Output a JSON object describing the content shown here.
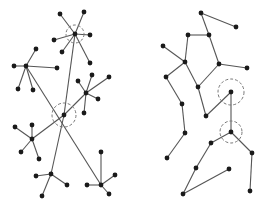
{
  "colors": {
    "background": "#ffffff",
    "edge": "#555555",
    "node": "#1a1a1a",
    "highlight": "#777777"
  },
  "graphs": [
    {
      "name": "left-graph",
      "node_radius": 2.4,
      "nodes": [
        [
          75,
          34
        ],
        [
          60,
          14
        ],
        [
          84,
          12
        ],
        [
          90,
          35
        ],
        [
          54,
          40
        ],
        [
          62,
          52
        ],
        [
          90,
          63
        ],
        [
          26,
          66
        ],
        [
          36,
          49
        ],
        [
          14,
          66
        ],
        [
          57,
          68
        ],
        [
          18,
          89
        ],
        [
          33,
          90
        ],
        [
          86,
          93
        ],
        [
          78,
          81
        ],
        [
          92,
          75
        ],
        [
          109,
          77
        ],
        [
          98,
          99
        ],
        [
          84,
          113
        ],
        [
          64,
          115
        ],
        [
          32,
          139
        ],
        [
          15,
          127
        ],
        [
          32,
          125
        ],
        [
          21,
          152
        ],
        [
          39,
          159
        ],
        [
          51,
          174
        ],
        [
          36,
          176
        ],
        [
          67,
          185
        ],
        [
          42,
          196
        ],
        [
          101,
          185
        ],
        [
          101,
          152
        ],
        [
          115,
          175
        ],
        [
          87,
          185
        ],
        [
          109,
          194
        ]
      ],
      "edges": [
        [
          0,
          1
        ],
        [
          0,
          2
        ],
        [
          0,
          3
        ],
        [
          0,
          4
        ],
        [
          0,
          5
        ],
        [
          0,
          6
        ],
        [
          7,
          8
        ],
        [
          7,
          9
        ],
        [
          7,
          10
        ],
        [
          7,
          11
        ],
        [
          7,
          12
        ],
        [
          13,
          14
        ],
        [
          13,
          15
        ],
        [
          13,
          16
        ],
        [
          13,
          17
        ],
        [
          13,
          18
        ],
        [
          0,
          19
        ],
        [
          7,
          29
        ],
        [
          13,
          19
        ],
        [
          19,
          20
        ],
        [
          19,
          25
        ],
        [
          20,
          21
        ],
        [
          20,
          22
        ],
        [
          20,
          23
        ],
        [
          20,
          24
        ],
        [
          25,
          26
        ],
        [
          25,
          27
        ],
        [
          25,
          28
        ],
        [
          29,
          30
        ],
        [
          29,
          31
        ],
        [
          29,
          32
        ],
        [
          29,
          33
        ]
      ],
      "highlights": [
        {
          "node": 0,
          "r": 9
        },
        {
          "node": 19,
          "r": 12
        }
      ]
    },
    {
      "name": "right-graph",
      "node_radius": 2.4,
      "nodes": [
        [
          201,
          13
        ],
        [
          236,
          27
        ],
        [
          188,
          35
        ],
        [
          209,
          35
        ],
        [
          163,
          46
        ],
        [
          185,
          62
        ],
        [
          219,
          64
        ],
        [
          247,
          68
        ],
        [
          166,
          77
        ],
        [
          198,
          87
        ],
        [
          231,
          92
        ],
        [
          182,
          104
        ],
        [
          206,
          116
        ],
        [
          185,
          133
        ],
        [
          167,
          158
        ],
        [
          231,
          132
        ],
        [
          211,
          143
        ],
        [
          252,
          153
        ],
        [
          196,
          168
        ],
        [
          229,
          169
        ],
        [
          183,
          194
        ],
        [
          250,
          191
        ]
      ],
      "edges": [
        [
          0,
          1
        ],
        [
          0,
          3
        ],
        [
          2,
          3
        ],
        [
          2,
          5
        ],
        [
          4,
          5
        ],
        [
          3,
          6
        ],
        [
          6,
          7
        ],
        [
          5,
          8
        ],
        [
          5,
          9
        ],
        [
          8,
          11
        ],
        [
          9,
          6
        ],
        [
          9,
          12
        ],
        [
          10,
          12
        ],
        [
          11,
          13
        ],
        [
          13,
          14
        ],
        [
          10,
          15
        ],
        [
          15,
          16
        ],
        [
          15,
          17
        ],
        [
          17,
          21
        ],
        [
          16,
          18
        ],
        [
          18,
          20
        ],
        [
          20,
          19
        ]
      ],
      "highlights": [
        {
          "node": 10,
          "r": 13
        },
        {
          "node": 15,
          "r": 11
        }
      ]
    }
  ]
}
